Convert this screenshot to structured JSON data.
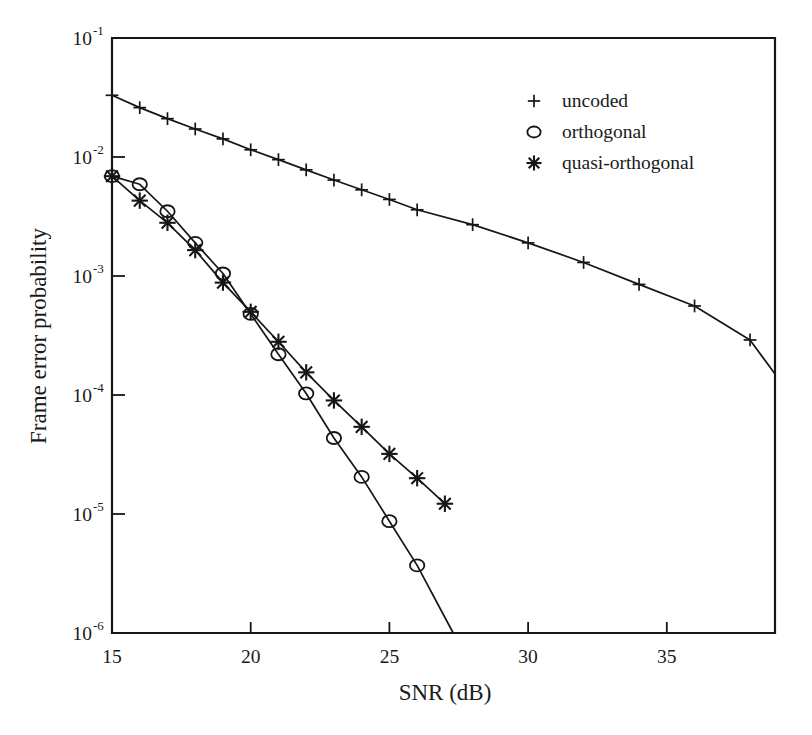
{
  "chart_data": {
    "type": "line",
    "title": "",
    "xlabel": "SNR (dB)",
    "ylabel": "Frame error probability",
    "xlim": [
      15,
      38.9
    ],
    "ylim": [
      1e-06,
      0.1
    ],
    "yscale": "log",
    "xscale": "linear",
    "grid": false,
    "legend_position": "top-right",
    "xticks": [
      15,
      20,
      25,
      30,
      35
    ],
    "xtick_labels": [
      "15",
      "20",
      "25",
      "30",
      "35"
    ],
    "yticks": [
      0.1,
      0.01,
      0.001,
      0.0001,
      1e-05,
      1e-06
    ],
    "ytick_labels": [
      "10",
      "10",
      "10",
      "10",
      "10",
      "10"
    ],
    "ytick_exponents": [
      "-1",
      "-2",
      "-3",
      "-4",
      "-5",
      "-6"
    ],
    "series": [
      {
        "name": "uncoded",
        "marker": "plus",
        "x": [
          15,
          16,
          17,
          18,
          19,
          20,
          21,
          22,
          23,
          24,
          25,
          26,
          28,
          30,
          32,
          34,
          36,
          38
        ],
        "y": [
          0.033,
          0.026,
          0.021,
          0.0172,
          0.0142,
          0.0115,
          0.0095,
          0.0078,
          0.0064,
          0.0053,
          0.0044,
          0.0036,
          0.0027,
          0.0019,
          0.0013,
          0.00085,
          0.00056,
          0.00029
        ],
        "y_end": 0.00015,
        "x_end": 38.9
      },
      {
        "name": "orthogonal",
        "marker": "circle",
        "x": [
          15,
          16,
          17,
          18,
          19,
          20,
          21,
          22,
          23,
          24,
          25,
          26
        ],
        "y": [
          0.0069,
          0.0059,
          0.0035,
          0.0019,
          0.00105,
          0.00048,
          0.00022,
          0.000103,
          4.35e-05,
          2.05e-05,
          8.7e-06,
          3.7e-06
        ],
        "y_end": 1e-06,
        "x_end": 27.3
      },
      {
        "name": "quasi-orthogonal",
        "marker": "asterisk",
        "x": [
          15,
          16,
          17,
          18,
          19,
          20,
          21,
          22,
          23,
          24,
          25,
          26,
          27
        ],
        "y": [
          0.0069,
          0.0043,
          0.0028,
          0.00165,
          0.00088,
          0.0005,
          0.00028,
          0.000155,
          9e-05,
          5.4e-05,
          3.2e-05,
          2e-05,
          1.22e-05
        ]
      }
    ],
    "legend": [
      {
        "marker": "plus",
        "label": "uncoded"
      },
      {
        "marker": "circle",
        "label": "orthogonal"
      },
      {
        "marker": "asterisk",
        "label": "quasi-orthogonal"
      }
    ]
  },
  "colors": {
    "ink": "#161616",
    "background": "#ffffff"
  }
}
